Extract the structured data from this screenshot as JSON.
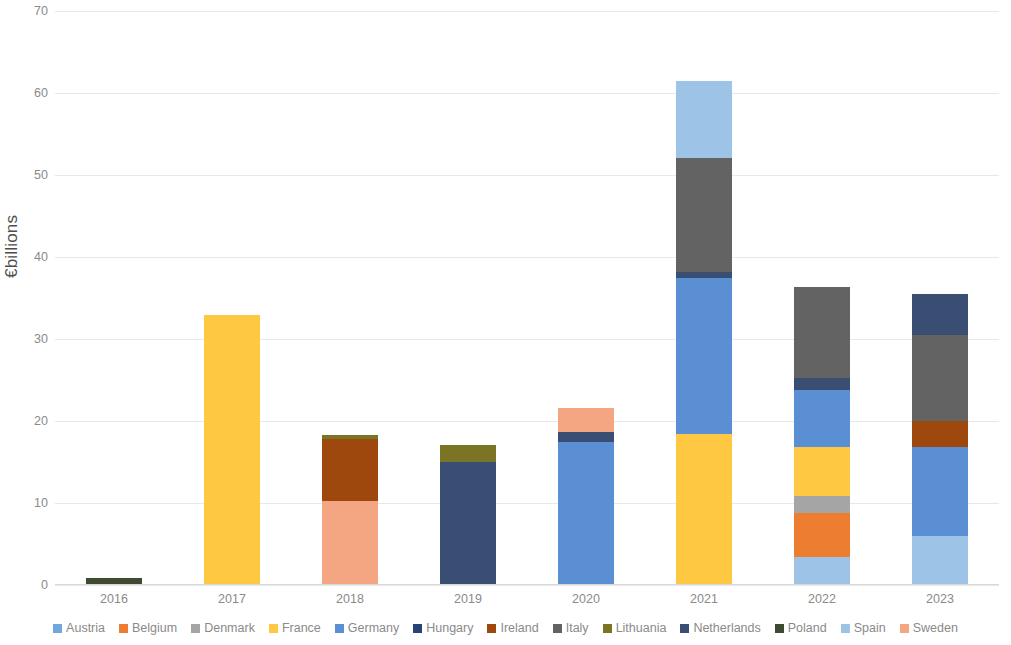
{
  "chart_data": {
    "type": "bar",
    "stacked": true,
    "title": "",
    "xlabel": "",
    "ylabel": "€billions",
    "ylim": [
      0,
      70
    ],
    "ytick_step": 10,
    "ytick_labels": [
      "0",
      "10",
      "20",
      "30",
      "40",
      "50",
      "60",
      "70"
    ],
    "grid": true,
    "legend_position": "bottom",
    "categories": [
      "2016",
      "2017",
      "2018",
      "2019",
      "2020",
      "2021",
      "2022",
      "2023"
    ],
    "series": [
      {
        "name": "Austria",
        "color": "#70A7DE",
        "values": [
          0,
          0,
          0,
          0,
          0,
          0,
          0,
          0
        ]
      },
      {
        "name": "Belgium",
        "color": "#ED7D31",
        "values": [
          0,
          0,
          0,
          0,
          0,
          0,
          5.4,
          0
        ]
      },
      {
        "name": "Denmark",
        "color": "#A5A5A5",
        "values": [
          0,
          0,
          0,
          0,
          0,
          0,
          2.1,
          0
        ]
      },
      {
        "name": "France",
        "color": "#FFC843",
        "values": [
          0,
          32.9,
          0,
          0,
          0,
          18.4,
          5.9,
          0
        ]
      },
      {
        "name": "Germany",
        "color": "#5B8FD4",
        "values": [
          0,
          0,
          0,
          0,
          17.4,
          19.1,
          7.0,
          10.8
        ]
      },
      {
        "name": "Hungary",
        "color": "#264478",
        "values": [
          0,
          0,
          0,
          0,
          0,
          0,
          0,
          0
        ]
      },
      {
        "name": "Ireland",
        "color": "#9E480E",
        "values": [
          0,
          7.6,
          0,
          0,
          0,
          0,
          0,
          3.2
        ]
      },
      {
        "name": "Italy",
        "color": "#636363",
        "values": [
          0,
          0,
          0,
          0,
          0,
          13.9,
          11.0,
          10.5
        ]
      },
      {
        "name": "Lithuania",
        "color": "#7C7425",
        "values": [
          0,
          0,
          0.5,
          2.1,
          0,
          0,
          0,
          0
        ]
      },
      {
        "name": "Netherlands",
        "color": "#3A4E73",
        "values": [
          0,
          0,
          0,
          15.0,
          1.3,
          0.7,
          1.5,
          5.0
        ]
      },
      {
        "name": "Poland",
        "color": "#3F4B30",
        "values": [
          0.8,
          0,
          0,
          0,
          0,
          0,
          0,
          0
        ]
      },
      {
        "name": "Spain",
        "color": "#9DC3E6",
        "values": [
          0,
          0,
          0,
          0,
          0,
          9.4,
          3.4,
          6.0
        ]
      },
      {
        "name": "Sweden",
        "color": "#F4A581",
        "values": [
          0,
          0,
          10.2,
          0,
          2.9,
          0,
          0,
          0
        ]
      }
    ],
    "stack_order": [
      "Austria",
      "Belgium",
      "Denmark",
      "France",
      "Germany",
      "Hungary",
      "Ireland",
      "Italy",
      "Lithuania",
      "Netherlands",
      "Poland",
      "Spain",
      "Sweden"
    ],
    "bars": [
      {
        "category": "2016",
        "total": 0.8,
        "segments": [
          {
            "series": "Poland",
            "value": 0.8
          }
        ]
      },
      {
        "category": "2017",
        "total": 32.9,
        "segments": [
          {
            "series": "France",
            "value": 32.9
          }
        ]
      },
      {
        "category": "2018",
        "total": 18.3,
        "segments": [
          {
            "series": "Sweden",
            "value": 10.2
          },
          {
            "series": "Ireland",
            "value": 7.6
          },
          {
            "series": "Lithuania",
            "value": 0.5
          }
        ]
      },
      {
        "category": "2019",
        "total": 17.1,
        "segments": [
          {
            "series": "Netherlands",
            "value": 15.0
          },
          {
            "series": "Lithuania",
            "value": 2.1
          }
        ]
      },
      {
        "category": "2020",
        "total": 21.6,
        "segments": [
          {
            "series": "Germany",
            "value": 17.4
          },
          {
            "series": "Netherlands",
            "value": 1.3
          },
          {
            "series": "Sweden",
            "value": 2.9
          }
        ]
      },
      {
        "category": "2021",
        "total": 61.5,
        "segments": [
          {
            "series": "France",
            "value": 18.4
          },
          {
            "series": "Germany",
            "value": 19.1
          },
          {
            "series": "Netherlands",
            "value": 0.7
          },
          {
            "series": "Italy",
            "value": 13.9
          },
          {
            "series": "Spain",
            "value": 9.4
          }
        ]
      },
      {
        "category": "2022",
        "total": 36.3,
        "segments": [
          {
            "series": "Spain",
            "value": 3.4
          },
          {
            "series": "Belgium",
            "value": 5.4
          },
          {
            "series": "Denmark",
            "value": 2.1
          },
          {
            "series": "France",
            "value": 5.9
          },
          {
            "series": "Germany",
            "value": 7.0
          },
          {
            "series": "Netherlands",
            "value": 1.5
          },
          {
            "series": "Italy",
            "value": 11.0
          }
        ]
      },
      {
        "category": "2023",
        "total": 35.5,
        "segments": [
          {
            "series": "Spain",
            "value": 6.0
          },
          {
            "series": "Germany",
            "value": 10.8
          },
          {
            "series": "Ireland",
            "value": 3.2
          },
          {
            "series": "Italy",
            "value": 10.5
          },
          {
            "series": "Netherlands",
            "value": 5.0
          }
        ]
      }
    ]
  },
  "legend": {
    "items": [
      {
        "label": "Austria",
        "color": "#70A7DE"
      },
      {
        "label": "Belgium",
        "color": "#ED7D31"
      },
      {
        "label": "Denmark",
        "color": "#A5A5A5"
      },
      {
        "label": "France",
        "color": "#FFC843"
      },
      {
        "label": "Germany",
        "color": "#5B8FD4"
      },
      {
        "label": "Hungary",
        "color": "#264478"
      },
      {
        "label": "Ireland",
        "color": "#9E480E"
      },
      {
        "label": "Italy",
        "color": "#636363"
      },
      {
        "label": "Lithuania",
        "color": "#7C7425"
      },
      {
        "label": "Netherlands",
        "color": "#3A4E73"
      },
      {
        "label": "Poland",
        "color": "#3F4B30"
      },
      {
        "label": "Spain",
        "color": "#9DC3E6"
      },
      {
        "label": "Sweden",
        "color": "#F4A581"
      }
    ]
  }
}
